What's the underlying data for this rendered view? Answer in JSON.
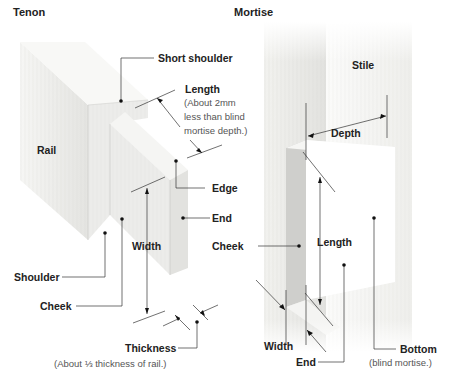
{
  "tenon": {
    "title": "Tenon",
    "labels": {
      "short_shoulder": "Short shoulder",
      "length": "Length",
      "length_note_1": "(About 2mm",
      "length_note_2": "less than blind",
      "length_note_3": "mortise depth.)",
      "rail": "Rail",
      "edge": "Edge",
      "end": "End",
      "cheek_right": "Cheek",
      "width": "Width",
      "shoulder": "Shoulder",
      "cheek": "Cheek",
      "thickness": "Thickness",
      "thickness_note": "(About ⅓ thickness of rail.)"
    }
  },
  "mortise": {
    "title": "Mortise",
    "labels": {
      "stile": "Stile",
      "depth": "Depth",
      "cheek": "Cheek",
      "length": "Length",
      "width": "Width",
      "end": "End",
      "bottom": "Bottom",
      "bottom_note": "(blind mortise.)"
    }
  },
  "colors": {
    "wood_light": "#f4f4f2",
    "wood_mid": "#e6e6e3",
    "wood_dark": "#d2d2cf",
    "line": "#333333",
    "text": "#222222",
    "note": "#555555"
  }
}
